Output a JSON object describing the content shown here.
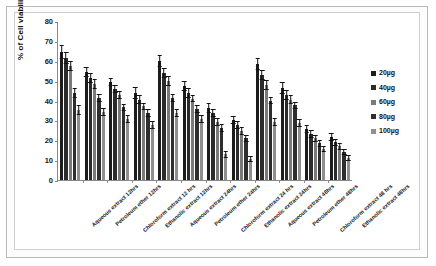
{
  "chart_data": {
    "type": "bar",
    "title": "",
    "xlabel": "",
    "ylabel": "% of Cell viability",
    "ylim": [
      0,
      80
    ],
    "yticks": [
      0,
      10,
      20,
      30,
      40,
      50,
      60,
      70,
      80
    ],
    "grid": false,
    "legend_position": "right",
    "categories": [
      "Aqueous extract 12hrs",
      "Petroleum ether 12hrs",
      "Chloroform extract 12 hrs",
      "Ethanolic extract 12hrs",
      "Aqueous extract 24hrs",
      "Petroleum ether 24hrs",
      "Chloroform extract 24 hrs",
      "Ethanolic extract 24hrs",
      "Aqueous extract 48hrs",
      "Petroleum ether 48hrs",
      "Chloroform extract 48 hrs",
      "Ethanolic extract 48hrs"
    ],
    "series": [
      {
        "name": "20µg",
        "color": "#1c1c1c",
        "values": [
          64.5,
          54.5,
          49.5,
          44.0,
          60.0,
          47.5,
          36.0,
          30.0,
          58.5,
          46.5,
          25.5,
          21.5
        ],
        "errors": [
          3.5,
          2.5,
          2.0,
          3.0,
          3.0,
          2.5,
          2.5,
          2.0,
          3.0,
          3.0,
          2.0,
          2.0
        ]
      },
      {
        "name": "40µg",
        "color": "#2b2b2b",
        "values": [
          61.5,
          51.5,
          46.0,
          40.5,
          54.0,
          44.0,
          33.5,
          27.5,
          53.0,
          43.0,
          23.0,
          19.0
        ],
        "errors": [
          3.0,
          2.5,
          2.0,
          2.5,
          2.5,
          2.5,
          2.0,
          2.0,
          2.5,
          2.5,
          2.0,
          1.8
        ]
      },
      {
        "name": "60µg",
        "color": "#7a7a7a",
        "values": [
          57.5,
          48.5,
          43.0,
          37.0,
          50.0,
          41.0,
          29.0,
          24.5,
          48.0,
          40.5,
          21.0,
          17.0
        ],
        "errors": [
          2.5,
          2.5,
          2.0,
          2.0,
          2.5,
          2.0,
          2.0,
          2.0,
          2.5,
          2.5,
          1.8,
          1.8
        ]
      },
      {
        "name": "80µg",
        "color": "#2e2e2e",
        "values": [
          44.0,
          41.5,
          36.5,
          33.5,
          41.5,
          35.5,
          26.0,
          21.0,
          40.0,
          37.5,
          18.5,
          14.0
        ],
        "errors": [
          2.5,
          2.0,
          2.0,
          2.0,
          2.0,
          2.0,
          2.0,
          1.8,
          2.0,
          2.0,
          1.8,
          1.5
        ]
      },
      {
        "name": "100µg",
        "color": "#8f8f8f",
        "values": [
          35.0,
          34.0,
          30.5,
          27.5,
          33.5,
          30.5,
          13.0,
          10.5,
          29.0,
          28.5,
          15.5,
          11.0
        ],
        "errors": [
          2.5,
          2.0,
          2.0,
          2.0,
          2.0,
          2.0,
          1.8,
          1.5,
          2.0,
          2.0,
          1.5,
          1.5
        ]
      }
    ]
  },
  "legend": {
    "items": [
      {
        "label": "20µg",
        "color": "#1c1c1c"
      },
      {
        "label": "40µg",
        "color": "#2b2b2b"
      },
      {
        "label": "60µg",
        "color": "#7a7a7a"
      },
      {
        "label": "80µg",
        "color": "#2e2e2e"
      },
      {
        "label": "100µg",
        "color": "#8f8f8f"
      }
    ]
  },
  "axis": {
    "y_title": "% of Cell viability",
    "y_tick_labels": [
      "80",
      "70",
      "60",
      "50",
      "40",
      "30",
      "20",
      "10",
      "0"
    ]
  }
}
